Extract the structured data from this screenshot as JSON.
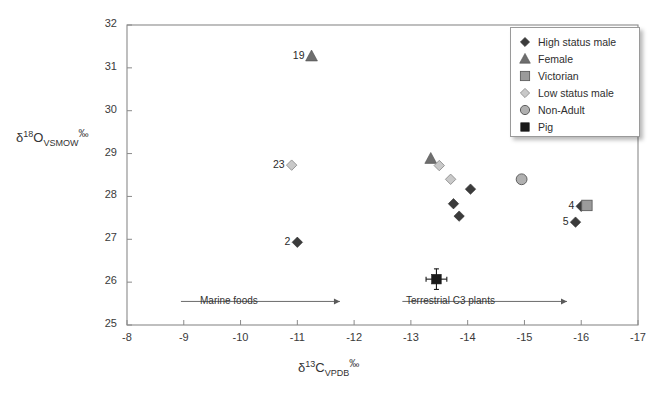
{
  "chart_data": {
    "type": "scatter",
    "title": "",
    "xlabel": "δ13C_VPDB ‰",
    "ylabel": "δ18O_VSMOW ‰",
    "xlabel_parts": {
      "delta": "δ",
      "iso": "13",
      "element": "C",
      "standard": "VPDB",
      "unit": "‰"
    },
    "ylabel_parts": {
      "delta": "δ",
      "iso": "18",
      "element": "O",
      "standard": "VSMOW",
      "unit": "‰"
    },
    "xlim": [
      -8,
      -17
    ],
    "ylim": [
      25,
      32
    ],
    "x_reversed": true,
    "xticks": [
      -8,
      -9,
      -10,
      -11,
      -12,
      -13,
      -14,
      -15,
      -16,
      -17
    ],
    "yticks": [
      25,
      26,
      27,
      28,
      29,
      30,
      31,
      32
    ],
    "grid": false,
    "legend_position": "top-right",
    "series": [
      {
        "name": "High status male",
        "marker": "diamond-filled-dark",
        "color": "#3b3b3b",
        "points": [
          {
            "x": -11.0,
            "y": 26.93,
            "label": "2"
          },
          {
            "x": -14.05,
            "y": 28.17,
            "label": ""
          },
          {
            "x": -13.75,
            "y": 27.83,
            "label": ""
          },
          {
            "x": -13.85,
            "y": 27.54,
            "label": ""
          },
          {
            "x": -16.0,
            "y": 27.77,
            "label": "4"
          },
          {
            "x": -15.9,
            "y": 27.4,
            "label": "5"
          }
        ]
      },
      {
        "name": "Female",
        "marker": "triangle-filled-grey",
        "color": "#6e6e6e",
        "points": [
          {
            "x": -11.25,
            "y": 31.27,
            "label": "19"
          },
          {
            "x": -13.35,
            "y": 28.88,
            "label": ""
          }
        ]
      },
      {
        "name": "Victorian",
        "marker": "square-grey",
        "color": "#8d8d8d",
        "points": [
          {
            "x": -16.1,
            "y": 27.79,
            "label": ""
          }
        ]
      },
      {
        "name": "Low status male",
        "marker": "diamond-light",
        "color": "#c2c2c2",
        "points": [
          {
            "x": -10.9,
            "y": 28.73,
            "label": "23"
          },
          {
            "x": -13.5,
            "y": 28.72,
            "label": ""
          },
          {
            "x": -13.7,
            "y": 28.4,
            "label": ""
          }
        ]
      },
      {
        "name": "Non-Adult",
        "marker": "circle-grey",
        "color": "#a8a8a8",
        "points": [
          {
            "x": -14.95,
            "y": 28.4,
            "label": ""
          }
        ]
      },
      {
        "name": "Pig",
        "marker": "square-black-errorbar",
        "color": "#1a1a1a",
        "points": [
          {
            "x": -13.45,
            "y": 26.07,
            "label": "",
            "xerr": 0.13,
            "yerr": 0.17
          }
        ]
      }
    ],
    "annotations": [
      {
        "text": "Marine foods",
        "arrow": "left",
        "x_start": -8.95,
        "x_end": -11.75,
        "y": 25.55
      },
      {
        "text": "Terrestrial C3 plants",
        "arrow": "right",
        "x_start": -12.85,
        "x_end": -15.75,
        "y": 25.55
      }
    ]
  },
  "legend": {
    "items": [
      {
        "label": "High status male",
        "marker": "diamond-filled-dark"
      },
      {
        "label": "Female",
        "marker": "triangle-filled-grey"
      },
      {
        "label": "Victorian",
        "marker": "square-grey"
      },
      {
        "label": "Low status male",
        "marker": "diamond-light"
      },
      {
        "label": "Non-Adult",
        "marker": "circle-grey"
      },
      {
        "label": "Pig",
        "marker": "square-black-errorbar"
      }
    ]
  },
  "colors": {
    "axis": "#7a7a7a",
    "text": "#3a3a3a",
    "dark_marker": "#3b3b3b",
    "mid_marker": "#6e6e6e",
    "light_marker": "#c2c2c2",
    "black_marker": "#1a1a1a"
  }
}
